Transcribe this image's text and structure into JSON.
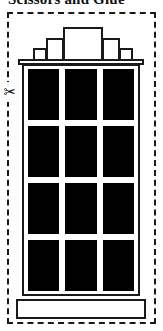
{
  "page": {
    "title": "Scissors and Glue",
    "background_color": "#ffffff",
    "ink_color": "#1a1a1a",
    "window_fill_color": "#000000",
    "width": 163,
    "height": 331
  },
  "cut_border": {
    "name": "cut-line",
    "style": "dashed",
    "color": "#1a1a1a"
  },
  "scissors_marker": {
    "icon": "scissors-icon",
    "glyph": "✂",
    "label": "Cut along the dashed line"
  },
  "illustration": {
    "subject": "skyscraper-building",
    "style": "black-and-white-line-art",
    "roof": {
      "type": "stepped-ziggurat",
      "step_count": 5,
      "blocks": [
        {
          "name": "roof-step-far-left",
          "left": 33,
          "top": 48,
          "width": 14,
          "height": 14
        },
        {
          "name": "roof-step-left",
          "left": 46,
          "top": 38,
          "width": 18,
          "height": 24
        },
        {
          "name": "roof-step-center",
          "left": 63,
          "top": 27,
          "width": 40,
          "height": 35
        },
        {
          "name": "roof-step-right",
          "left": 102,
          "top": 38,
          "width": 18,
          "height": 24
        },
        {
          "name": "roof-step-far-right",
          "left": 119,
          "top": 48,
          "width": 14,
          "height": 14
        }
      ]
    },
    "cornice": {
      "name": "cornice-band"
    },
    "tower": {
      "name": "tower-body"
    },
    "windows": {
      "rows": 4,
      "columns": 3,
      "total": 12,
      "fill": "solid-black",
      "items": [
        "window-r1-c1",
        "window-r1-c2",
        "window-r1-c3",
        "window-r2-c1",
        "window-r2-c2",
        "window-r2-c3",
        "window-r3-c1",
        "window-r3-c2",
        "window-r3-c3",
        "window-r4-c1",
        "window-r4-c2",
        "window-r4-c3"
      ]
    },
    "base": {
      "name": "foundation-slab"
    }
  }
}
